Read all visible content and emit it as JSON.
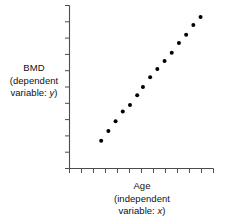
{
  "figure": {
    "background_color": "#ffffff",
    "axis_color": "#4d4d4d",
    "marker_color": "#000000"
  },
  "axes": {
    "y_label_lines": [
      "BMD",
      "(dependent",
      "variable: y)"
    ],
    "y_label_variable": "y",
    "x_label_lines": [
      "Age",
      "(independent",
      "variable: x)"
    ],
    "x_label_variable": "x",
    "y_tick_count": 11,
    "x_tick_count": 13,
    "spines": [
      "left",
      "bottom"
    ]
  },
  "chart_data": {
    "type": "scatter",
    "title": "",
    "xlabel": "Age (independent variable: x)",
    "ylabel": "BMD (dependent variable: y)",
    "xlim": [
      0,
      100
    ],
    "ylim": [
      0,
      100
    ],
    "grid": false,
    "legend": null,
    "series": [
      {
        "name": "BMD vs Age",
        "marker": "circle",
        "color": "#000000",
        "x": [
          22,
          27,
          32,
          37,
          42,
          47,
          51,
          56,
          61,
          66,
          71,
          76,
          81,
          86,
          91
        ],
        "y": [
          17,
          23,
          29,
          35,
          39,
          45,
          50,
          56,
          61,
          66,
          71,
          77,
          82,
          88,
          93
        ]
      }
    ]
  }
}
